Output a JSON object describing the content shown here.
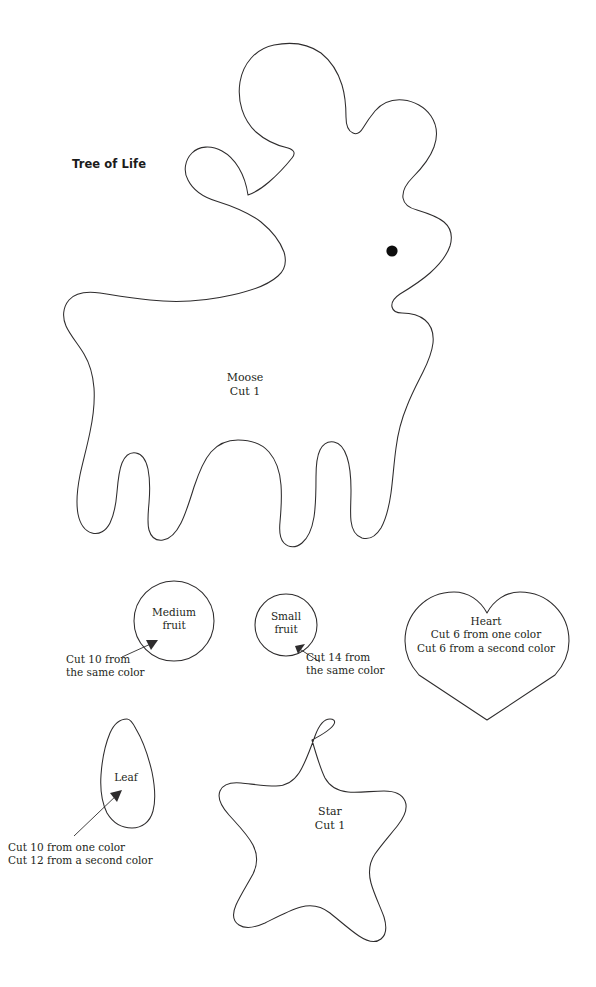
{
  "page": {
    "title": "Tree of Life",
    "background_color": "#ffffff",
    "outline_color": "#2e2c2d",
    "text_color": "#231f20"
  },
  "shapes": {
    "moose": {
      "name": "Moose",
      "label_line1": "Moose",
      "label_line2": "Cut 1",
      "label": "Moose\nCut 1",
      "has_eye": true
    },
    "medium_fruit": {
      "name": "Medium fruit",
      "label_line1": "Medium",
      "label_line2": "fruit",
      "label": "Medium\nfruit",
      "caption_line1": "Cut 10 from",
      "caption_line2": "the same color",
      "caption": "Cut 10 from\nthe same color"
    },
    "small_fruit": {
      "name": "Small fruit",
      "label_line1": "Small",
      "label_line2": "fruit",
      "label": "Small\nfruit",
      "caption_line1": "Cut 14 from",
      "caption_line2": "the same color",
      "caption": "Cut 14 from\nthe same color"
    },
    "heart": {
      "name": "Heart",
      "label_line1": "Heart",
      "label_line2": "Cut 6 from one color",
      "label_line3": "Cut 6 from a second color",
      "label": "Heart\nCut 6 from one color\nCut 6 from a second color"
    },
    "leaf": {
      "name": "Leaf",
      "label": "Leaf",
      "caption_line1": "Cut 10 from one color",
      "caption_line2": "Cut 12 from a second color",
      "caption": "Cut 10 from one color\nCut 12 from a second color"
    },
    "star": {
      "name": "Star",
      "label_line1": "Star",
      "label_line2": "Cut 1",
      "label": "Star\nCut 1"
    }
  }
}
